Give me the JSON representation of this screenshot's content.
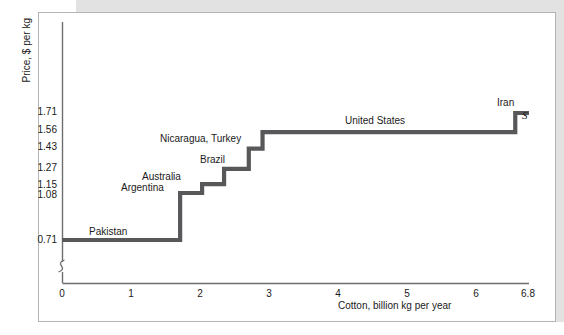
{
  "chart_data": {
    "type": "line",
    "subtype": "step",
    "title": "",
    "xlabel": "Cotton, billion kg per year",
    "ylabel": "Price, $ per kg",
    "xlim": [
      0,
      6.8
    ],
    "ylim": [
      0.0,
      2.0
    ],
    "grid": false,
    "legend_position": "none",
    "axis_break_y": true,
    "curve_annotation": "S",
    "xticks": [
      "0",
      "1",
      "2",
      "3",
      "4",
      "5",
      "6",
      "6.8"
    ],
    "xtick_values": [
      0,
      1,
      2,
      3,
      4,
      5,
      6,
      6.8
    ],
    "yticks": [
      "0.71",
      "1.08",
      "1.15",
      "1.27",
      "1.43",
      "1.56",
      "1.71"
    ],
    "ytick_values": [
      0.71,
      1.08,
      1.15,
      1.27,
      1.43,
      1.56,
      1.71
    ],
    "series": [
      {
        "name": "Supply curve S",
        "color": "#58585a",
        "steps": [
          {
            "label": "Pakistan",
            "price": 0.71,
            "x_start": 0.0,
            "x_end": 1.72
          },
          {
            "label": "Argentina",
            "price": 1.08,
            "x_start": 1.72,
            "x_end": 2.04
          },
          {
            "label": "Australia",
            "price": 1.15,
            "x_start": 2.04,
            "x_end": 2.36
          },
          {
            "label": "Brazil",
            "price": 1.27,
            "x_start": 2.36,
            "x_end": 2.72
          },
          {
            "label": "Nicaragua, Turkey",
            "price": 1.43,
            "x_start": 2.72,
            "x_end": 2.92
          },
          {
            "label": "United States",
            "price": 1.56,
            "x_start": 2.92,
            "x_end": 6.6
          },
          {
            "label": "Iran",
            "price": 1.71,
            "x_start": 6.6,
            "x_end": 6.8
          }
        ]
      }
    ],
    "point_labels": [
      {
        "text": "Pakistan",
        "x": 1.0,
        "price": 0.745
      },
      {
        "text": "Argentina",
        "x": 1.7,
        "price": 1.115
      },
      {
        "text": "Australia",
        "x": 1.92,
        "price": 1.215
      },
      {
        "text": "Brazil",
        "x": 2.47,
        "price": 1.325
      },
      {
        "text": "Nicaragua, Turkey",
        "x": 2.12,
        "price": 1.485
      },
      {
        "text": "United States",
        "x": 4.25,
        "price": 1.615
      },
      {
        "text": "Iran",
        "x": 6.4,
        "price": 1.775
      }
    ]
  },
  "axes": {
    "y_title": "Price, $ per kg",
    "x_title": "Cotton, billion kg per year",
    "supply_label": "S"
  }
}
